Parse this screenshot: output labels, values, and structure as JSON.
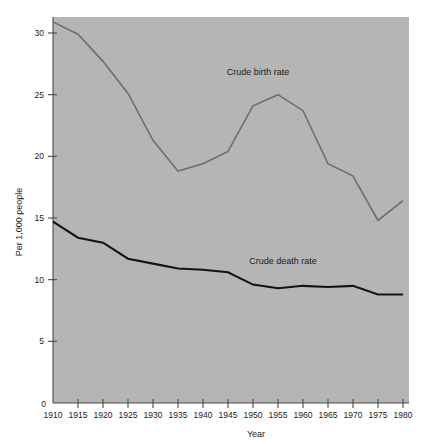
{
  "chart_data": {
    "type": "line",
    "title": "",
    "xlabel": "Year",
    "ylabel": "Per 1,000 people",
    "xlim": [
      1910,
      1980
    ],
    "ylim": [
      0,
      30
    ],
    "grid": false,
    "legend_position": "inline-annotation",
    "x": [
      1910,
      1915,
      1920,
      1925,
      1930,
      1935,
      1940,
      1945,
      1950,
      1955,
      1960,
      1965,
      1970,
      1975,
      1980
    ],
    "xticks": [
      "1910",
      "1915",
      "1920",
      "1925",
      "1930",
      "1935",
      "1940",
      "1945",
      "1950",
      "1955",
      "1960",
      "1965",
      "1970",
      "1975",
      "1980"
    ],
    "yticks": [
      "0",
      "5",
      "10",
      "15",
      "20",
      "25",
      "30"
    ],
    "ytick_values": [
      0,
      5,
      10,
      15,
      20,
      25,
      30
    ],
    "series": [
      {
        "name": "Crude birth rate",
        "color": "#6e6e6e",
        "values": [
          30.9,
          29.9,
          27.7,
          25.1,
          21.3,
          18.8,
          19.4,
          20.4,
          24.1,
          25.0,
          23.7,
          19.4,
          18.4,
          14.8,
          16.4
        ],
        "annotation": "Crude birth rate",
        "annotation_x": 1951,
        "annotation_y": 26.6
      },
      {
        "name": "Crude death rate",
        "color": "#141414",
        "values": [
          14.7,
          13.4,
          13.0,
          11.7,
          11.3,
          10.9,
          10.8,
          10.6,
          9.6,
          9.3,
          9.5,
          9.4,
          9.5,
          8.8,
          8.8
        ],
        "annotation": "Crude death rate",
        "annotation_x": 1956,
        "annotation_y": 11.3
      }
    ]
  },
  "axes": {
    "y_axis_label": "Per 1,000 people",
    "x_axis_label": "Year",
    "origin_label": "0"
  },
  "colors": {
    "plot_background": "#b5b5b5",
    "page_background": "#ffffff",
    "axis": "#4a4a4a",
    "birth_series": "#6e6e6e",
    "death_series": "#141414",
    "text": "#1a1a1a"
  }
}
